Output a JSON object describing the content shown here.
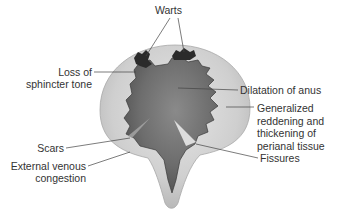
{
  "figure": {
    "type": "anatomical-illustration",
    "colors": {
      "outer_tissue": "#c9c9c9",
      "anal_region": "#6e6e6e",
      "wart": "#2b2b2b",
      "label_text": "#333333",
      "leader_line": "#444444"
    }
  },
  "labels": {
    "warts": "Warts",
    "loss_of_sphincter_tone": [
      "Loss of",
      "sphincter tone"
    ],
    "dilatation_of_anus": "Dilatation of anus",
    "generalized_reddening": [
      "Generalized",
      "reddening and",
      "thickening of",
      "perianal tissue"
    ],
    "scars": "Scars",
    "external_venous_congestion": [
      "External venous",
      "congestion"
    ],
    "fissures": "Fissures"
  }
}
